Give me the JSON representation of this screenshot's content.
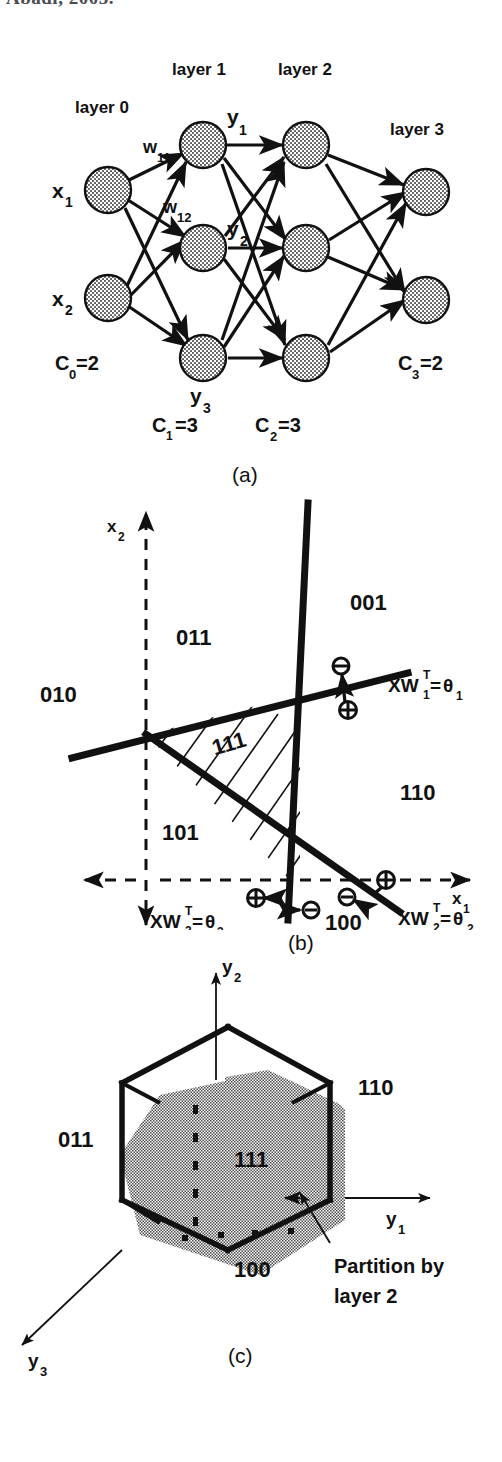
{
  "page": {
    "header_remnant": "Abadi, 2003.",
    "width": 502,
    "height": 1462,
    "background": "#ffffff",
    "ink": "#111111"
  },
  "figure_a": {
    "caption": "(a)",
    "title_labels": {
      "layer0": "layer 0",
      "layer1": "layer 1",
      "layer2": "layer 2",
      "layer3": "layer 3"
    },
    "input_labels": [
      "x",
      "1",
      "x",
      "2"
    ],
    "input_nodes": [
      {
        "label_base": "x",
        "label_sub": "1"
      },
      {
        "label_base": "x",
        "label_sub": "2"
      }
    ],
    "weight_labels": [
      {
        "base": "w",
        "sub": "11"
      },
      {
        "base": "w",
        "sub": "12"
      }
    ],
    "hidden_labels": [
      {
        "base": "y",
        "sub": "1"
      },
      {
        "base": "y",
        "sub": "2"
      },
      {
        "base": "y",
        "sub": "3"
      }
    ],
    "counts": [
      {
        "base": "C",
        "sub": "0",
        "value": "=2"
      },
      {
        "base": "C",
        "sub": "1",
        "value": "=3"
      },
      {
        "base": "C",
        "sub": "2",
        "value": "=3"
      },
      {
        "base": "C",
        "sub": "3",
        "value": "=2"
      }
    ],
    "layer_sizes": [
      2,
      3,
      3,
      2
    ],
    "node_fill": "#d8d8d8"
  },
  "figure_b": {
    "caption": "(b)",
    "axes": {
      "x_axis_label_base": "x",
      "x_axis_label_sub": "1",
      "y_axis_label_base": "x",
      "y_axis_label_sub": "2",
      "style": "dashed"
    },
    "region_labels": [
      "011",
      "010",
      "101",
      "111",
      "001",
      "110",
      "100"
    ],
    "hatched_region": "111",
    "line_labels": [
      {
        "prefix": "XW",
        "sup": "T",
        "sub": "1",
        "eq": "=",
        "theta": "θ",
        "theta_sub": "1"
      },
      {
        "prefix": "XW",
        "sup": "T",
        "sub": "2",
        "eq": "=",
        "theta": "θ",
        "theta_sub": "2"
      },
      {
        "prefix": "XW",
        "sup": "T",
        "sub": "3",
        "eq": "=",
        "theta": "θ",
        "theta_sub": "3"
      }
    ],
    "sign_markers": [
      "⊖",
      "⊕",
      "⊕",
      "⊖",
      "⊕",
      "⊖"
    ]
  },
  "figure_c": {
    "caption": "(c)",
    "axes": [
      {
        "base": "y",
        "sub": "1"
      },
      {
        "base": "y",
        "sub": "2"
      },
      {
        "base": "y",
        "sub": "3"
      }
    ],
    "vertex_labels": [
      "110",
      "011",
      "100"
    ],
    "interior_label": "111",
    "annotation_line1": "Partition  by",
    "annotation_line2": "layer  2",
    "cube_fill": "#a9a9a9"
  }
}
